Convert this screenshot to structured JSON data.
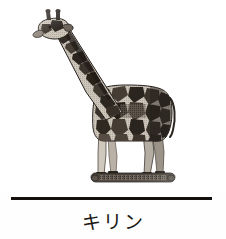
{
  "page": {
    "background_color": "#ffffff",
    "width": 226,
    "height": 239
  },
  "figure": {
    "name": "giraffe-photograph",
    "alt_label": "giraffe",
    "style": "halftone black-and-white printed photograph",
    "colors": {
      "patch_dark": "#2e2823",
      "patch_mid": "#5a5048",
      "coat_light": "#d9d2c8",
      "outline": "#1d1916",
      "base_dark": "#3b3530",
      "background": "#ffffff"
    }
  },
  "divider": {
    "name": "horizontal-rule",
    "color": "#14100e",
    "x": 11,
    "y": 197,
    "width": 201,
    "thickness": 3
  },
  "caption": {
    "text": "キリン",
    "color": "#1b1714",
    "font_size": 19,
    "align": "center"
  }
}
